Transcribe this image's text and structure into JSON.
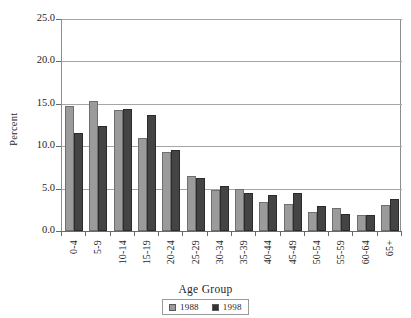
{
  "chart_data": {
    "type": "bar",
    "title": "",
    "xlabel": "Age Group",
    "ylabel": "Percent",
    "ylim": [
      0.0,
      25.0
    ],
    "yticks": [
      "0.0",
      "5.0",
      "10.0",
      "15.0",
      "20.0",
      "25.0"
    ],
    "ytick_values": [
      0.0,
      5.0,
      10.0,
      15.0,
      20.0,
      25.0
    ],
    "grid": true,
    "legend_position": "bottom-center",
    "categories": [
      "0-4",
      "5-9",
      "10-14",
      "15-19",
      "20-24",
      "25-29",
      "30-34",
      "35-39",
      "40-44",
      "45-49",
      "50-54",
      "55-59",
      "60-64",
      "65+"
    ],
    "series": [
      {
        "name": "1988",
        "color": "#9b9b9b",
        "values": [
          14.8,
          15.3,
          14.3,
          11.0,
          9.3,
          6.5,
          4.8,
          5.0,
          3.4,
          3.2,
          2.2,
          2.7,
          1.9,
          3.1
        ]
      },
      {
        "name": "1998",
        "color": "#444444",
        "values": [
          11.6,
          12.4,
          14.4,
          13.7,
          9.6,
          6.2,
          5.3,
          4.5,
          4.2,
          4.5,
          3.0,
          2.0,
          1.9,
          3.8
        ]
      }
    ]
  },
  "legend": {
    "entries": [
      {
        "label": "1988",
        "swatch": "series-1-swatch"
      },
      {
        "label": "1998",
        "swatch": "series-2-swatch"
      }
    ]
  }
}
